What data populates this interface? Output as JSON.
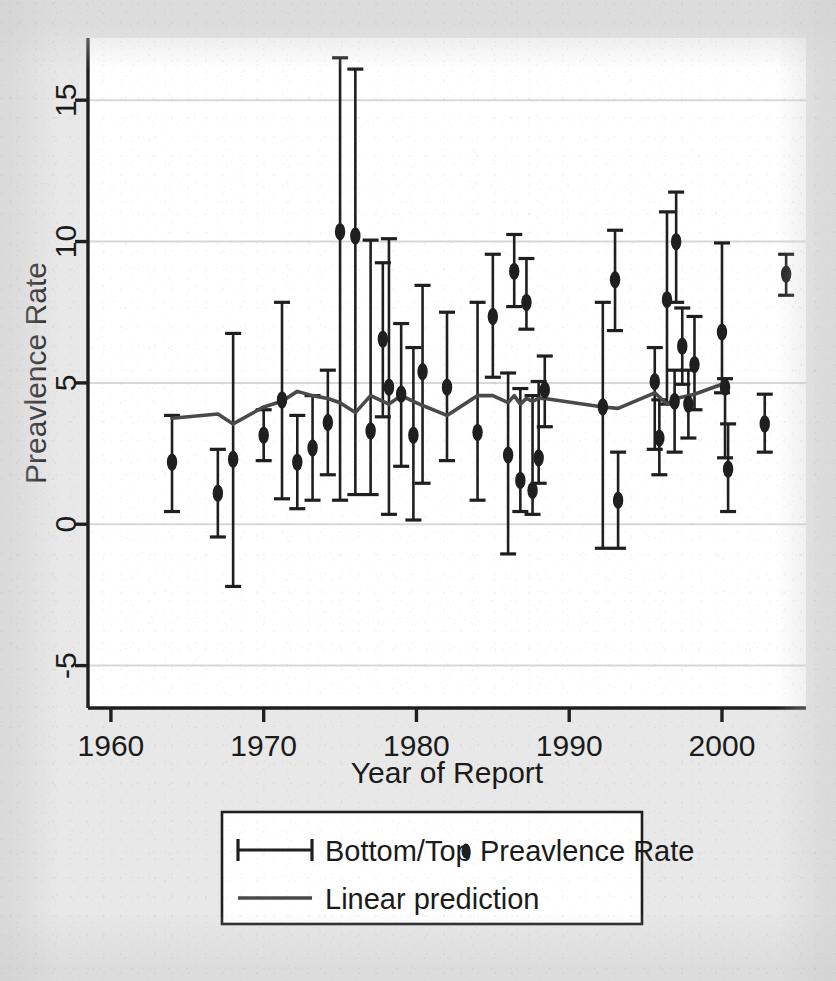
{
  "figure": {
    "background_color": "#e8e8e8",
    "plot_background_color": "#ffffff",
    "ink_color": "#1f1f1f",
    "gridline_color": "#d8d8d8"
  },
  "chart_data": {
    "type": "scatter",
    "title": "",
    "xlabel": "Year of Report",
    "ylabel": "Preavlence Rate",
    "xlim": [
      1958.5,
      2005.5
    ],
    "ylim": [
      -6.5,
      17.2
    ],
    "xticks": [
      1960,
      1970,
      1980,
      1990,
      2000
    ],
    "xtick_labels": [
      "1960",
      "1970",
      "1980",
      "1990",
      "2000"
    ],
    "yticks": [
      -5,
      0,
      5,
      10,
      15
    ],
    "ytick_labels": [
      "-5",
      "0",
      "5",
      "10",
      "15"
    ],
    "grid": "horizontal",
    "legend_position": "below-axes",
    "series": [
      {
        "name": "Preavlence Rate",
        "marker": "filled-circle",
        "error_bar_name": "Bottom/Top",
        "points": [
          {
            "x": 1964.0,
            "y": 2.2,
            "lo": 0.45,
            "hi": 3.85
          },
          {
            "x": 1967.0,
            "y": 1.1,
            "lo": -0.45,
            "hi": 2.65
          },
          {
            "x": 1968.0,
            "y": 2.3,
            "lo": -2.2,
            "hi": 6.75
          },
          {
            "x": 1970.0,
            "y": 3.15,
            "lo": 2.25,
            "hi": 4.05
          },
          {
            "x": 1971.2,
            "y": 4.4,
            "lo": 0.9,
            "hi": 7.85
          },
          {
            "x": 1972.2,
            "y": 2.2,
            "lo": 0.55,
            "hi": 3.85
          },
          {
            "x": 1973.2,
            "y": 2.7,
            "lo": 0.85,
            "hi": 4.55
          },
          {
            "x": 1974.2,
            "y": 3.6,
            "lo": 1.75,
            "hi": 5.45
          },
          {
            "x": 1975.0,
            "y": 10.35,
            "lo": 0.85,
            "hi": 16.5
          },
          {
            "x": 1976.0,
            "y": 10.2,
            "lo": 1.05,
            "hi": 16.1
          },
          {
            "x": 1977.0,
            "y": 3.3,
            "lo": 1.05,
            "hi": 10.05
          },
          {
            "x": 1977.8,
            "y": 6.55,
            "lo": 3.8,
            "hi": 9.25
          },
          {
            "x": 1978.2,
            "y": 4.85,
            "lo": 0.35,
            "hi": 10.1
          },
          {
            "x": 1979.0,
            "y": 4.6,
            "lo": 2.05,
            "hi": 7.1
          },
          {
            "x": 1979.8,
            "y": 3.15,
            "lo": 0.15,
            "hi": 6.25
          },
          {
            "x": 1980.4,
            "y": 5.4,
            "lo": 1.45,
            "hi": 8.45
          },
          {
            "x": 1982.0,
            "y": 4.85,
            "lo": 2.25,
            "hi": 7.5
          },
          {
            "x": 1984.0,
            "y": 3.25,
            "lo": 0.85,
            "hi": 7.85
          },
          {
            "x": 1985.0,
            "y": 7.35,
            "lo": 5.2,
            "hi": 9.55
          },
          {
            "x": 1986.0,
            "y": 2.45,
            "lo": -1.05,
            "hi": 5.35
          },
          {
            "x": 1986.4,
            "y": 8.95,
            "lo": 7.7,
            "hi": 10.25
          },
          {
            "x": 1986.8,
            "y": 1.55,
            "lo": 0.45,
            "hi": 4.8
          },
          {
            "x": 1987.2,
            "y": 7.85,
            "lo": 6.9,
            "hi": 9.4
          },
          {
            "x": 1987.6,
            "y": 1.2,
            "lo": 0.35,
            "hi": 4.55
          },
          {
            "x": 1988.0,
            "y": 2.35,
            "lo": 1.45,
            "hi": 5.05
          },
          {
            "x": 1988.4,
            "y": 4.75,
            "lo": 3.45,
            "hi": 5.95
          },
          {
            "x": 1992.2,
            "y": 4.15,
            "lo": -0.85,
            "hi": 7.85
          },
          {
            "x": 1993.2,
            "y": 0.85,
            "lo": -0.85,
            "hi": 2.55
          },
          {
            "x": 1993.0,
            "y": 8.65,
            "lo": 6.85,
            "hi": 10.4
          },
          {
            "x": 1995.6,
            "y": 5.05,
            "lo": 2.65,
            "hi": 6.25
          },
          {
            "x": 1995.9,
            "y": 3.05,
            "lo": 1.75,
            "hi": 4.4
          },
          {
            "x": 1996.4,
            "y": 7.95,
            "lo": 4.25,
            "hi": 11.05
          },
          {
            "x": 1996.9,
            "y": 4.35,
            "lo": 2.55,
            "hi": 5.45
          },
          {
            "x": 1997.0,
            "y": 10.0,
            "lo": 7.85,
            "hi": 11.75
          },
          {
            "x": 1997.4,
            "y": 6.3,
            "lo": 4.95,
            "hi": 7.65
          },
          {
            "x": 1997.8,
            "y": 4.25,
            "lo": 3.05,
            "hi": 5.45
          },
          {
            "x": 1998.2,
            "y": 5.65,
            "lo": 4.05,
            "hi": 7.35
          },
          {
            "x": 2000.0,
            "y": 6.8,
            "lo": 4.65,
            "hi": 9.95
          },
          {
            "x": 2000.2,
            "y": 4.85,
            "lo": 2.35,
            "hi": 5.15
          },
          {
            "x": 2000.4,
            "y": 1.95,
            "lo": 0.45,
            "hi": 3.55
          },
          {
            "x": 2002.8,
            "y": 3.55,
            "lo": 2.55,
            "hi": 4.6
          },
          {
            "x": 2004.2,
            "y": 8.85,
            "lo": 8.1,
            "hi": 9.55
          }
        ]
      },
      {
        "name": "Linear prediction",
        "marker": "line",
        "points": [
          {
            "x": 1964.0,
            "y": 3.75
          },
          {
            "x": 1967.0,
            "y": 3.9
          },
          {
            "x": 1968.0,
            "y": 3.55
          },
          {
            "x": 1970.0,
            "y": 4.15
          },
          {
            "x": 1971.2,
            "y": 4.35
          },
          {
            "x": 1972.2,
            "y": 4.7
          },
          {
            "x": 1973.2,
            "y": 4.55
          },
          {
            "x": 1974.2,
            "y": 4.45
          },
          {
            "x": 1975.0,
            "y": 4.3
          },
          {
            "x": 1976.0,
            "y": 3.95
          },
          {
            "x": 1977.0,
            "y": 4.55
          },
          {
            "x": 1977.8,
            "y": 4.35
          },
          {
            "x": 1978.2,
            "y": 4.25
          },
          {
            "x": 1979.0,
            "y": 4.55
          },
          {
            "x": 1979.8,
            "y": 4.35
          },
          {
            "x": 1980.4,
            "y": 4.2
          },
          {
            "x": 1982.0,
            "y": 3.85
          },
          {
            "x": 1984.0,
            "y": 4.55
          },
          {
            "x": 1985.0,
            "y": 4.55
          },
          {
            "x": 1986.0,
            "y": 4.3
          },
          {
            "x": 1986.4,
            "y": 4.55
          },
          {
            "x": 1986.8,
            "y": 4.25
          },
          {
            "x": 1987.2,
            "y": 4.45
          },
          {
            "x": 1987.6,
            "y": 4.35
          },
          {
            "x": 1988.0,
            "y": 4.45
          },
          {
            "x": 1988.4,
            "y": 4.45
          },
          {
            "x": 1992.2,
            "y": 4.15
          },
          {
            "x": 1993.2,
            "y": 4.1
          },
          {
            "x": 1995.6,
            "y": 4.65
          },
          {
            "x": 1996.4,
            "y": 4.25
          },
          {
            "x": 1997.0,
            "y": 4.45
          },
          {
            "x": 1998.2,
            "y": 4.6
          },
          {
            "x": 2000.0,
            "y": 4.95
          },
          {
            "x": 2000.4,
            "y": 4.85
          }
        ]
      }
    ]
  },
  "legend": {
    "entries": [
      {
        "marker": "errorbar",
        "label": "Bottom/Top"
      },
      {
        "marker": "dot",
        "label": "Preavlence Rate"
      },
      {
        "marker": "line",
        "label": "Linear prediction"
      }
    ]
  }
}
